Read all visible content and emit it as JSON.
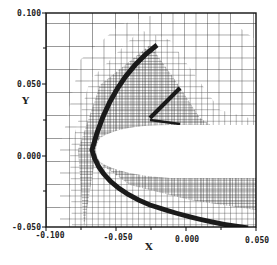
{
  "figure": {
    "type": "adaptive-mesh-plot",
    "xlabel": "X",
    "ylabel": "Y",
    "xlim": [
      -0.1,
      0.05
    ],
    "ylim": [
      -0.05,
      0.1
    ],
    "x_ticks": [
      "-0.100",
      "-0.050",
      "0.000",
      "0.050"
    ],
    "y_ticks": [
      "0.100",
      "0.050",
      "0.000",
      "-0.050"
    ],
    "colors": {
      "ink": "#1a1a1a",
      "mesh": "#333333",
      "background": "#ffffff"
    }
  }
}
